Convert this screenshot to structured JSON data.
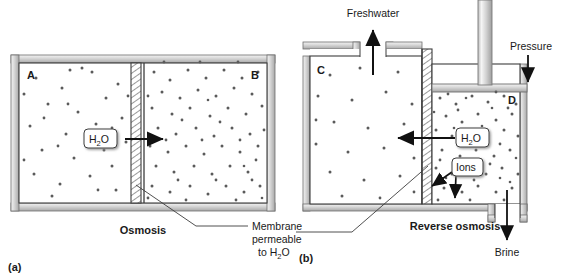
{
  "figure": {
    "title_hidden": "",
    "panels": [
      {
        "id": "a",
        "panel_label": "(a)",
        "caption": "Osmosis",
        "chambers": [
          {
            "label": "A",
            "description": "dilute solution"
          },
          {
            "label": "B",
            "description": "concentrated solution"
          }
        ],
        "callouts": [
          {
            "name": "water-flow",
            "label": "H",
            "sub": "2",
            "label2": "O",
            "direction": "right"
          }
        ],
        "annotation": {
          "line1": "Membrane",
          "line2": "permeable",
          "line3_pre": "to H",
          "line3_sub": "2",
          "line3_post": "O"
        }
      },
      {
        "id": "b",
        "panel_label": "(b)",
        "caption": "Reverse osmosis",
        "chambers": [
          {
            "label": "C",
            "description": "freshwater side"
          },
          {
            "label": "D",
            "description": "brine side"
          }
        ],
        "callouts": [
          {
            "name": "water-flow",
            "label": "H",
            "sub": "2",
            "label2": "O",
            "direction": "left"
          },
          {
            "name": "ions",
            "label": "Ions",
            "direction": "blocked"
          }
        ],
        "ports": [
          {
            "name": "freshwater-outlet",
            "label": "Freshwater",
            "direction": "up"
          },
          {
            "name": "pressure-piston",
            "label": "Pressure",
            "direction": "down"
          },
          {
            "name": "brine-outlet",
            "label": "Brine",
            "direction": "down"
          }
        ]
      }
    ]
  },
  "colors": {
    "wall_light": "#e8e8e8",
    "wall_mid": "#c9c9c9",
    "wall_dark": "#9a9a9a",
    "outline": "#3c3c3c",
    "dot": "#5a5a5a",
    "text": "#1a1a1a",
    "background": "#ffffff"
  }
}
